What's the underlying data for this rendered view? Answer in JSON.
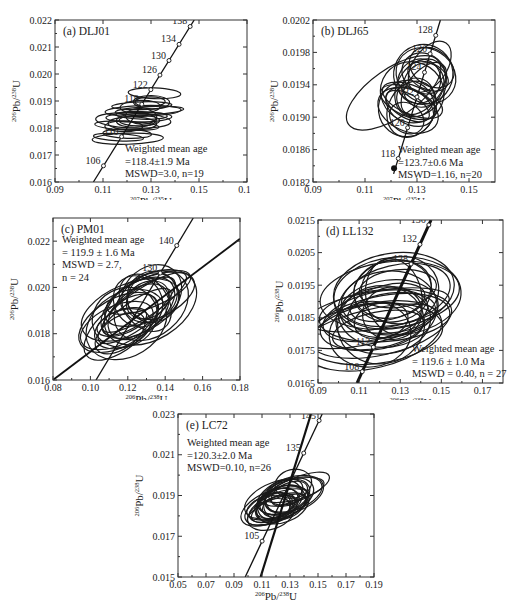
{
  "chart_data": [
    {
      "id": "a",
      "type": "scatter",
      "subtype": "concordia-ellipses",
      "title": "(a) DLJ01",
      "xlabel": "207Pb/235U",
      "ylabel": "206Pb/238U",
      "xlim": [
        0.09,
        0.17
      ],
      "ylim": [
        0.016,
        0.022
      ],
      "xticks": [
        "0.09",
        "0.11",
        "0.13",
        "0.15",
        "0.17"
      ],
      "yticks": [
        "0.016",
        "0.017",
        "0.018",
        "0.019",
        "0.020",
        "0.021",
        "0.022"
      ],
      "concordia_labels": [
        "106",
        "110",
        "118",
        "122",
        "126",
        "130",
        "134",
        "138"
      ],
      "annotation": [
        "Weighted mean age",
        "=118.4±1.9 Ma",
        "MSWD=3.0, n=19"
      ],
      "weighted_mean_age_ma": 118.4,
      "error_ma": 1.9,
      "mswd": 3.0,
      "n": 19
    },
    {
      "id": "b",
      "type": "scatter",
      "subtype": "concordia-ellipses",
      "title": "(b) DLJ65",
      "xlabel": "207Pb/235U",
      "ylabel": "206Pb/238U",
      "xlim": [
        0.09,
        0.16
      ],
      "ylim": [
        0.0182,
        0.0202
      ],
      "xticks": [
        "0.09",
        "0.11",
        "0.13",
        "0.15"
      ],
      "yticks": [
        "0.0182",
        "0.0186",
        "0.0190",
        "0.0194",
        "0.0198",
        "0.0202"
      ],
      "concordia_labels": [
        "118",
        "120",
        "122",
        "124",
        "126",
        "128"
      ],
      "annotation": [
        "Weighted mean age",
        "=123.7±0.6 Ma",
        "MSWD=1.16, n=20"
      ],
      "weighted_mean_age_ma": 123.7,
      "error_ma": 0.6,
      "mswd": 1.16,
      "n": 20
    },
    {
      "id": "c",
      "type": "scatter",
      "subtype": "concordia-ellipses",
      "title": "(c) PM01",
      "xlabel": "206Pb/238U",
      "ylabel": "206Pb/238U",
      "xlim": [
        0.08,
        0.18
      ],
      "ylim": [
        0.016,
        0.023
      ],
      "xticks": [
        "0.08",
        "0.10",
        "0.12",
        "0.14",
        "0.16",
        "0.18"
      ],
      "yticks": [
        "0.016",
        "0.018",
        "0.020",
        "0.022"
      ],
      "concordia_labels": [
        "130",
        "140"
      ],
      "annotation": [
        "Weighted mean age",
        "= 119.9 ± 1.6 Ma",
        "MSWD = 2.7,",
        "n = 24"
      ],
      "weighted_mean_age_ma": 119.9,
      "error_ma": 1.6,
      "mswd": 2.7,
      "n": 24
    },
    {
      "id": "d",
      "type": "scatter",
      "subtype": "concordia-ellipses",
      "title": "(d) LL132",
      "xlabel": "206Pb/238U",
      "ylabel": "206Pb/238U",
      "xlim": [
        0.09,
        0.18
      ],
      "ylim": [
        0.0165,
        0.0215
      ],
      "xticks": [
        "0.09",
        "0.11",
        "0.13",
        "0.15",
        "0.17"
      ],
      "yticks": [
        "0.0165",
        "0.0175",
        "0.0185",
        "0.0195",
        "0.0205",
        "0.0215"
      ],
      "concordia_labels": [
        "108",
        "112",
        "128",
        "132",
        "136"
      ],
      "annotation": [
        "Weighted mean age",
        "= 119.6 ± 1.0 Ma",
        "MSWD = 0.40, n = 27"
      ],
      "weighted_mean_age_ma": 119.6,
      "error_ma": 1.0,
      "mswd": 0.4,
      "n": 27
    },
    {
      "id": "e",
      "type": "scatter",
      "subtype": "concordia-ellipses",
      "title": "(e) LC72",
      "xlabel": "206Pb/238U",
      "ylabel": "206Pb/238U",
      "xlim": [
        0.05,
        0.19
      ],
      "ylim": [
        0.015,
        0.023
      ],
      "xticks": [
        "0.05",
        "0.07",
        "0.09",
        "0.11",
        "0.13",
        "0.15",
        "0.17",
        "0.19"
      ],
      "yticks": [
        "0.015",
        "0.017",
        "0.019",
        "0.021",
        "0.023"
      ],
      "concordia_labels": [
        "105",
        "135",
        "145"
      ],
      "annotation": [
        "Weighted mean age",
        "=120.3±2.0 Ma",
        "MSWD=0.10, n=26"
      ],
      "weighted_mean_age_ma": 120.3,
      "error_ma": 2.0,
      "mswd": 0.1,
      "n": 26
    }
  ]
}
